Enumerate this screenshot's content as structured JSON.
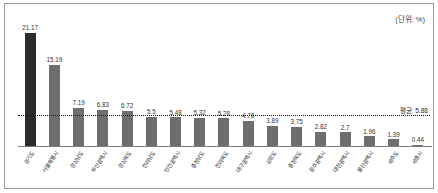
{
  "frame": {
    "unit_note": "(단위: %)"
  },
  "chart_data": {
    "type": "bar",
    "title": "",
    "subtitle": "",
    "xlabel": "",
    "ylabel": "",
    "unit_note": "(단위: %)",
    "grid": false,
    "legend_position": "none",
    "ylim": [
      0,
      22
    ],
    "categories": [
      "경기도",
      "서울특별시",
      "경상남도",
      "부산광역시",
      "경상북도",
      "전라남도",
      "인천광역시",
      "충청남도",
      "전라북도",
      "대구광역시",
      "강원도",
      "충청북도",
      "광주광역시",
      "대전광역시",
      "울산광역시",
      "제주도",
      "세종시"
    ],
    "values": [
      21.17,
      15.19,
      7.19,
      6.83,
      6.72,
      5.5,
      5.48,
      5.32,
      5.28,
      4.78,
      3.89,
      3.75,
      2.82,
      2.7,
      1.96,
      1.39,
      0.44
    ],
    "value_labels": [
      "21.17",
      "15.19",
      "7.19",
      "6.83",
      "6.72",
      "5.5",
      "5.48",
      "5.32",
      "5.28",
      "4.78",
      "3.89",
      "3.75",
      "2.82",
      "2.7",
      "1.96",
      "1.39",
      "0.44"
    ],
    "highlight_index": 0,
    "bar_color": "#6e6e6e",
    "highlight_color": "#2b2b2b",
    "average": {
      "value": 5.88,
      "label": "평균: 5.88",
      "line_style": "dotted",
      "color": "#141414"
    }
  }
}
